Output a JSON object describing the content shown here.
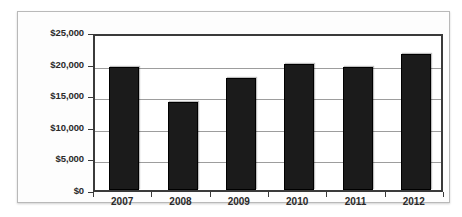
{
  "chart_data": {
    "type": "bar",
    "title": "",
    "xlabel": "",
    "ylabel": "",
    "categories": [
      "2007",
      "2008",
      "2009",
      "2010",
      "2011",
      "2012"
    ],
    "values": [
      19500,
      14000,
      17700,
      20000,
      19500,
      21600
    ],
    "ylim": [
      0,
      25000
    ],
    "y_ticks": [
      0,
      5000,
      10000,
      15000,
      20000,
      25000
    ],
    "y_tick_labels": [
      "$0",
      "$5,000",
      "$10,000",
      "$15,000",
      "$20,000",
      "$25,000"
    ],
    "grid": true,
    "legend": false,
    "series": [
      {
        "name": "",
        "color": "#1b1b1b",
        "values": [
          19500,
          14000,
          17700,
          20000,
          19500,
          21600
        ]
      }
    ]
  },
  "colors": {
    "bar": "#1b1b1b",
    "gridline": "#9d9d9d",
    "axis": "#3a3a3a",
    "frame": "#b9b9b9",
    "text": "#2a2a2a",
    "plot_background": "#ffffff",
    "figure_background": "#fdfdfd"
  }
}
